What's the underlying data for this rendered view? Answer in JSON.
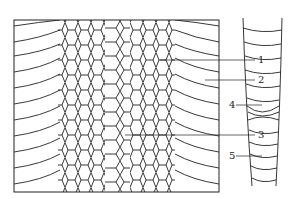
{
  "diagram": {
    "labels": [
      {
        "id": "1",
        "text": "1",
        "x": 258,
        "y": 56
      },
      {
        "id": "2",
        "text": "2",
        "x": 258,
        "y": 76
      },
      {
        "id": "3",
        "text": "3",
        "x": 258,
        "y": 131
      },
      {
        "id": "4",
        "text": "4",
        "x": 230,
        "y": 101
      },
      {
        "id": "5",
        "text": "5",
        "x": 230,
        "y": 152
      }
    ],
    "stroke_color": "#222222"
  }
}
